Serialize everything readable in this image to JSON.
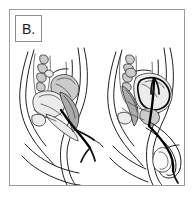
{
  "panel": {
    "label": "B.",
    "border_color": "#9a9a9a",
    "background_color": "#ffffff"
  },
  "illustration": {
    "title": "Sagittal pelvic anatomy, catheter insertion",
    "style": "grayscale line art",
    "line_color": "#1a1a1a",
    "fill_light": "#e8e8e8",
    "fill_mid": "#c9c9c9",
    "fill_dark": "#a8a8a8",
    "figures": [
      {
        "name": "female-pelvis-sagittal",
        "side": "left",
        "description": "Female pelvis midsagittal section with urinary catheter inserted through the urethra into the bladder",
        "structures": [
          "abdominal wall",
          "sacrum",
          "uterus",
          "bladder",
          "pubic symphysis",
          "vagina",
          "rectum",
          "urethra",
          "catheter tube"
        ]
      },
      {
        "name": "male-pelvis-sagittal",
        "side": "right",
        "description": "Male pelvis midsagittal section with urinary catheter inserted through the penile urethra into the bladder",
        "structures": [
          "abdominal wall",
          "sacrum",
          "bladder",
          "pubic symphysis",
          "prostate",
          "rectum",
          "penis",
          "scrotum",
          "urethra",
          "catheter tube"
        ]
      }
    ]
  }
}
